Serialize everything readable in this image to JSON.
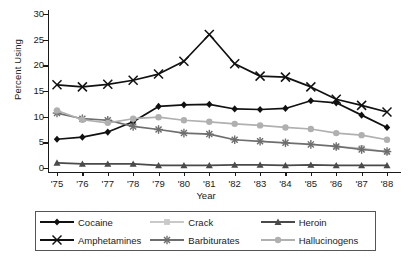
{
  "chart_data": {
    "type": "line",
    "title": "",
    "xlabel": "Year",
    "ylabel": "Percent Using",
    "categories": [
      "'75",
      "'76",
      "'77",
      "'78",
      "'79",
      "'80",
      "'81",
      "'82",
      "'83",
      "'84",
      "'85",
      "'86",
      "'87",
      "'88"
    ],
    "ylim": [
      0,
      30
    ],
    "yticks": [
      0,
      5,
      10,
      15,
      20,
      25,
      30
    ],
    "grid": false,
    "legend_position": "bottom",
    "series": [
      {
        "name": "Cocaine",
        "marker": "diamond",
        "color": "#111111",
        "values": [
          5.6,
          6.0,
          7.0,
          9.0,
          12.0,
          12.3,
          12.4,
          11.5,
          11.4,
          11.6,
          13.1,
          12.7,
          10.3,
          7.9
        ]
      },
      {
        "name": "Crack",
        "marker": "square",
        "color": "#c9c9c9",
        "values": [
          null,
          null,
          null,
          null,
          null,
          null,
          null,
          null,
          null,
          null,
          null,
          4.1,
          3.9,
          3.1
        ]
      },
      {
        "name": "Heroin",
        "marker": "triangle",
        "color": "#4a4a4a",
        "values": [
          1.0,
          0.8,
          0.8,
          0.8,
          0.5,
          0.5,
          0.5,
          0.6,
          0.6,
          0.5,
          0.6,
          0.5,
          0.5,
          0.5
        ]
      },
      {
        "name": "Amphetamines",
        "marker": "x",
        "color": "#111111",
        "values": [
          16.2,
          15.8,
          16.3,
          17.1,
          18.3,
          20.8,
          26.0,
          20.3,
          17.9,
          17.7,
          15.8,
          13.4,
          12.2,
          10.9
        ]
      },
      {
        "name": "Barbiturates",
        "marker": "asterisk",
        "color": "#6e6e6e",
        "values": [
          10.7,
          9.6,
          9.3,
          8.1,
          7.5,
          6.8,
          6.6,
          5.5,
          5.2,
          4.9,
          4.6,
          4.2,
          3.6,
          3.2
        ]
      },
      {
        "name": "Hallucinogens",
        "marker": "circle",
        "color": "#b0b0b0",
        "values": [
          11.2,
          9.4,
          8.8,
          9.6,
          9.9,
          9.3,
          9.0,
          8.6,
          8.3,
          7.9,
          7.6,
          6.8,
          6.4,
          5.5
        ]
      }
    ]
  },
  "legend": {
    "items": [
      {
        "label": "Cocaine"
      },
      {
        "label": "Crack"
      },
      {
        "label": "Heroin"
      },
      {
        "label": "Amphetamines"
      },
      {
        "label": "Barbiturates"
      },
      {
        "label": "Hallucinogens"
      }
    ]
  }
}
